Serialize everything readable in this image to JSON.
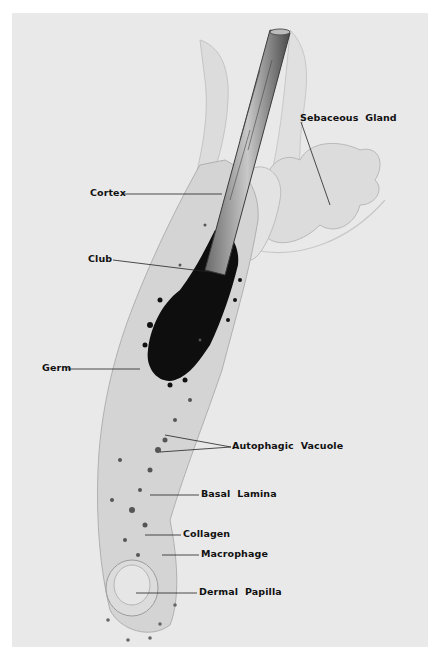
{
  "figure": {
    "background_color": "#e9e9e9",
    "page_color": "#ffffff",
    "labels": [
      {
        "id": "sebaceous-gland",
        "text": "Sebaceous  Gland",
        "x": 300,
        "y": 112
      },
      {
        "id": "cortex",
        "text": "Cortex",
        "x": 90,
        "y": 187
      },
      {
        "id": "club",
        "text": "Club",
        "x": 88,
        "y": 253
      },
      {
        "id": "germ",
        "text": "Germ",
        "x": 42,
        "y": 362
      },
      {
        "id": "autophagic-vacuole",
        "text": "Autophagic  Vacuole",
        "x": 232,
        "y": 442
      },
      {
        "id": "basal-lamina",
        "text": "Basal  Lamina",
        "x": 201,
        "y": 488
      },
      {
        "id": "collagen",
        "text": "Collagen",
        "x": 183,
        "y": 529
      },
      {
        "id": "macrophage",
        "text": "Macrophage",
        "x": 201,
        "y": 548
      },
      {
        "id": "dermal-papilla",
        "text": "Dermal  Papilla",
        "x": 199,
        "y": 586
      }
    ]
  }
}
